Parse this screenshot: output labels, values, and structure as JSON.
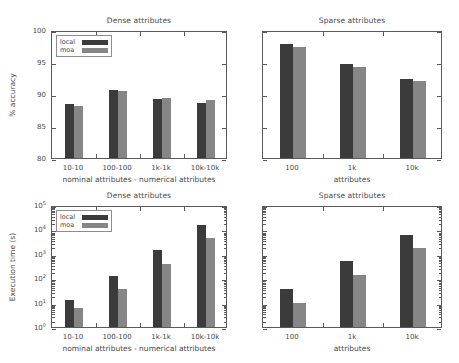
{
  "figure": {
    "legend": {
      "local_label": "local",
      "moa_label": "moa"
    },
    "colors": {
      "local": "#3b3b3b",
      "moa": "#868686",
      "axis": "#5a5a5a",
      "text": "#4a4a4a"
    }
  },
  "chart_data": [
    {
      "id": "top-left",
      "type": "bar",
      "title": "Dense attributes",
      "xlabel": "nominal attributes - numerical attributes",
      "ylabel": "% accuracy",
      "categories": [
        "10-10",
        "100-100",
        "1k-1k",
        "10k-10k"
      ],
      "series": [
        {
          "name": "local",
          "values": [
            88.4,
            90.7,
            89.2,
            88.6
          ]
        },
        {
          "name": "moa",
          "values": [
            88.2,
            90.5,
            89.3,
            89.0
          ]
        }
      ],
      "ylim": [
        80,
        100
      ],
      "yticks": [
        "100",
        "95",
        "90",
        "85",
        "80"
      ],
      "ytick_values": [
        100,
        95,
        90,
        85,
        80
      ],
      "yscale": "linear",
      "grid": false,
      "legend_position": "upper-left"
    },
    {
      "id": "top-right",
      "type": "bar",
      "title": "Sparse attributes",
      "xlabel": "attributes",
      "ylabel": "",
      "categories": [
        "100",
        "1k",
        "10k"
      ],
      "series": [
        {
          "name": "local",
          "values": [
            97.8,
            94.7,
            92.4
          ]
        },
        {
          "name": "moa",
          "values": [
            97.3,
            94.2,
            92.0
          ]
        }
      ],
      "ylim": [
        80,
        100
      ],
      "yticks": [],
      "ytick_values": [
        100,
        95,
        90,
        85,
        80
      ],
      "yscale": "linear",
      "grid": false,
      "legend_position": "none"
    },
    {
      "id": "bottom-left",
      "type": "bar",
      "title": "Dense attributes",
      "xlabel": "nominal attributes - numerical attributes",
      "ylabel": "Execution time (s)",
      "categories": [
        "10-10",
        "100-100",
        "1k-1k",
        "10k-10k"
      ],
      "series": [
        {
          "name": "local",
          "values": [
            13,
            120,
            1400,
            15000
          ]
        },
        {
          "name": "moa",
          "values": [
            6,
            36,
            400,
            4500
          ]
        }
      ],
      "ylim": [
        1,
        100000
      ],
      "yticks": [
        "10^5",
        "10^4",
        "10^3",
        "10^2",
        "10^1",
        "10^0"
      ],
      "ytick_values": [
        100000,
        10000,
        1000,
        100,
        10,
        1
      ],
      "yscale": "log",
      "grid": false,
      "legend_position": "upper-left"
    },
    {
      "id": "bottom-right",
      "type": "bar",
      "title": "Sparse attributes",
      "xlabel": "attributes",
      "ylabel": "",
      "categories": [
        "100",
        "1k",
        "10k"
      ],
      "series": [
        {
          "name": "local",
          "values": [
            35,
            500,
            6000
          ]
        },
        {
          "name": "moa",
          "values": [
            10,
            140,
            1700
          ]
        }
      ],
      "ylim": [
        1,
        100000
      ],
      "yticks": [],
      "ytick_values": [
        100000,
        10000,
        1000,
        100,
        10,
        1
      ],
      "yscale": "log",
      "grid": false,
      "legend_position": "none"
    }
  ]
}
